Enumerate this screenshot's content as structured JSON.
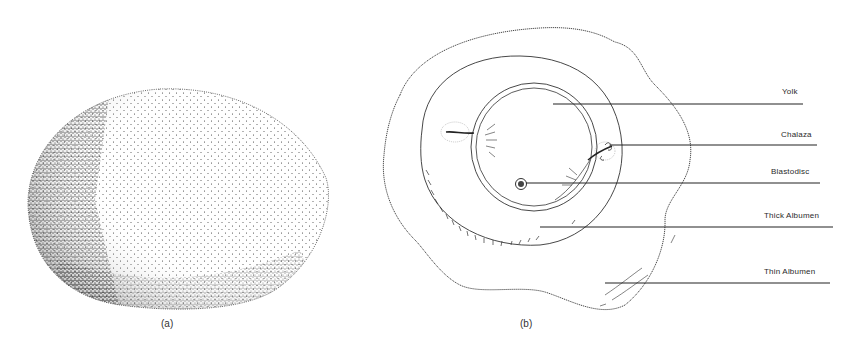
{
  "panel_a": {
    "caption": "(a)",
    "subject": "whole-egg-exterior"
  },
  "panel_b": {
    "caption": "(b)",
    "subject": "broken-out-egg-interior",
    "labels": [
      {
        "text": "Yolk",
        "line_y": 104,
        "line_x1": 553,
        "line_x2": 803
      },
      {
        "text": "Chalaza",
        "line_y": 145,
        "line_x1": 610,
        "line_x2": 817
      },
      {
        "text": "Blastodisc",
        "line_y": 183,
        "line_x1": 526,
        "line_x2": 820
      },
      {
        "text": "Thick Albumen",
        "line_y": 227,
        "line_x1": 540,
        "line_x2": 833
      },
      {
        "text": "Thin Albumen",
        "line_y": 283,
        "line_x1": 605,
        "line_x2": 830
      }
    ]
  },
  "colors": {
    "ink": "#2a2a2a",
    "background": "#ffffff"
  }
}
